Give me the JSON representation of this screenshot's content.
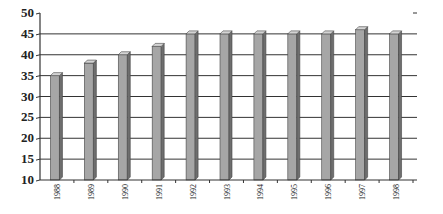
{
  "chart_data": {
    "type": "bar",
    "title": "",
    "xlabel": "",
    "ylabel": "",
    "categories": [
      "1988",
      "1989",
      "1990",
      "1991",
      "1992",
      "1993",
      "1994",
      "1995",
      "1996",
      "1997",
      "1998"
    ],
    "values": [
      35,
      38,
      40,
      42,
      45,
      45,
      45,
      45,
      45,
      46,
      45
    ],
    "ylim": [
      10,
      50
    ],
    "yticks": [
      10,
      15,
      20,
      25,
      30,
      35,
      40,
      45,
      50
    ],
    "grid": true,
    "legend": null,
    "style": "3d-bar",
    "colors": {
      "bar_front": "#a6a6a6",
      "bar_side": "#6e6e6e",
      "bar_top": "#d4d4d4",
      "grid": "#333333",
      "axis": "#333333"
    }
  }
}
